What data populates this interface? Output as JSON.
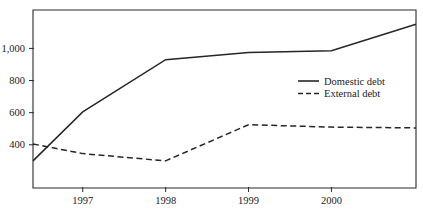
{
  "chart_data": {
    "type": "line",
    "title": "",
    "subtitle": "",
    "xlabel": "",
    "ylabel": "",
    "xtick_labels": [
      "1997",
      "1998",
      "1999",
      "2000"
    ],
    "xtick_values": [
      1997,
      1998,
      1999,
      2000
    ],
    "ytick_labels": [
      "400",
      "600",
      "800",
      "1,000"
    ],
    "ytick_values": [
      400,
      600,
      800,
      1000
    ],
    "xlim": [
      1996.4,
      1997,
      1998,
      1999,
      2000,
      2001.02
    ],
    "ylim": [
      131,
      1239
    ],
    "grid": false,
    "legend_position": "inside-right-upper",
    "x": [
      1996.4,
      1997,
      1998,
      1999,
      2000,
      2001.02
    ],
    "series": [
      {
        "name": "Domestic debt",
        "style": "solid",
        "color": "#262626",
        "values": [
          300,
          605,
          930,
          975,
          985,
          1150
        ]
      },
      {
        "name": "External debt",
        "style": "dashed",
        "color": "#262626",
        "values": [
          405,
          345,
          300,
          525,
          510,
          505
        ]
      }
    ],
    "legend": [
      {
        "label": "Domestic debt",
        "style": "solid"
      },
      {
        "label": "External debt",
        "style": "dashed"
      }
    ]
  },
  "axes": {
    "plot_left_px": 33,
    "plot_right_px": 416,
    "plot_top_px": 10,
    "plot_bottom_px": 188
  }
}
